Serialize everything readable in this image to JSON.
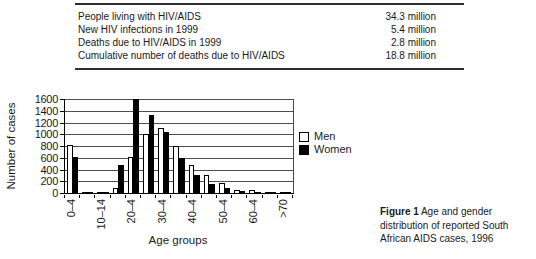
{
  "table": {
    "rows": [
      {
        "label": "People living with HIV/AIDS",
        "value": "34.3 million"
      },
      {
        "label": "New HIV infections in 1999",
        "value": "5.4 million"
      },
      {
        "label": "Deaths due to HIV/AIDS in 1999",
        "value": "2.8 million"
      },
      {
        "label": "Cumulative number of deaths due to HIV/AIDS",
        "value": "18.8 million"
      }
    ]
  },
  "caption": {
    "label": "Figure 1",
    "text": "Age and gender distribution of reported South African AIDS cases, 1996"
  },
  "chart_data": {
    "type": "bar",
    "title": "",
    "categories": [
      "0–4",
      "5–9",
      "10–14",
      "15–19",
      "20–24",
      "25–29",
      "30–34",
      "35–39",
      "40–44",
      "45–49",
      "50–54",
      "55–59",
      "60–64",
      "65–69",
      ">70"
    ],
    "series": [
      {
        "name": "Men",
        "color": "#ffffff",
        "values": [
          820,
          20,
          20,
          90,
          620,
          1000,
          1100,
          800,
          480,
          300,
          170,
          60,
          45,
          25,
          25
        ]
      },
      {
        "name": "Women",
        "color": "#000000",
        "values": [
          620,
          20,
          25,
          470,
          1600,
          1330,
          1040,
          590,
          300,
          160,
          80,
          30,
          25,
          15,
          15
        ]
      }
    ],
    "xlabel": "Age groups",
    "ylabel": "Number of cases",
    "ylim": [
      0,
      1600
    ],
    "yticks": [
      0,
      200,
      400,
      600,
      800,
      1000,
      1200,
      1400,
      1600
    ],
    "xtick_label_indices": [
      0,
      2,
      4,
      6,
      8,
      10,
      12,
      14
    ],
    "xtick_labels_shown": [
      "0–4",
      "10–14",
      "20–4",
      "30–4",
      "40–4",
      "50–4",
      "60–4",
      ">70"
    ],
    "grid": true,
    "legend_position": "right"
  }
}
